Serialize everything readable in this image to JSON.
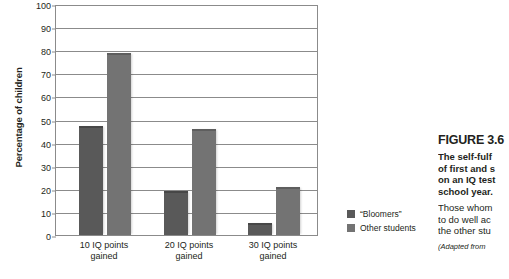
{
  "chart_data": {
    "type": "bar",
    "title": "",
    "xlabel": "",
    "ylabel": "Percentage of children",
    "ylim": [
      0,
      100
    ],
    "ytick_step": 10,
    "yticks": [
      0,
      10,
      20,
      30,
      40,
      50,
      60,
      70,
      80,
      90,
      100
    ],
    "grid": true,
    "legend_position": "right",
    "categories": [
      "10 IQ points gained",
      "20 IQ points gained",
      "30 IQ points gained"
    ],
    "category_lines": [
      [
        "10 IQ points",
        "gained"
      ],
      [
        "20 IQ points",
        "gained"
      ],
      [
        "30 IQ points",
        "gained"
      ]
    ],
    "series": [
      {
        "name": "“Bloomers”",
        "color": "#595959",
        "values": [
          47,
          19,
          5
        ]
      },
      {
        "name": "Other students",
        "color": "#737373",
        "values": [
          79,
          46,
          21
        ]
      }
    ]
  },
  "legend": {
    "items": [
      {
        "label": "“Bloomers”",
        "swatch_class": "sw-bloomers"
      },
      {
        "label": "Other students",
        "swatch_class": "sw-others"
      }
    ]
  },
  "caption": {
    "figure_number": "FIGURE 3.6",
    "lead_lines": [
      "The self-fulf",
      "of first and s",
      "on an IQ test",
      "school year."
    ],
    "body_lines": [
      "Those whom",
      "to do well ac",
      "the other stu"
    ],
    "source": "(Adapted from"
  },
  "colors": {
    "bloomers": "#595959",
    "other_students": "#737373",
    "axis": "#8b8b8b",
    "text": "#231f20",
    "background": "#ffffff"
  }
}
